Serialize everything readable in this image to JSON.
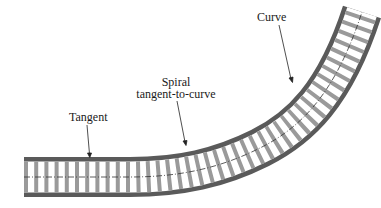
{
  "diagram": {
    "labels": {
      "tangent": "Tangent",
      "spiral_line1": "Spiral",
      "spiral_line2": "tangent-to-curve",
      "curve": "Curve"
    },
    "colors": {
      "rail": "#5a5a5a",
      "tie": "#9a9a9a",
      "centerline": "#333333",
      "text": "#1a1a1a",
      "background": "#ffffff"
    }
  }
}
